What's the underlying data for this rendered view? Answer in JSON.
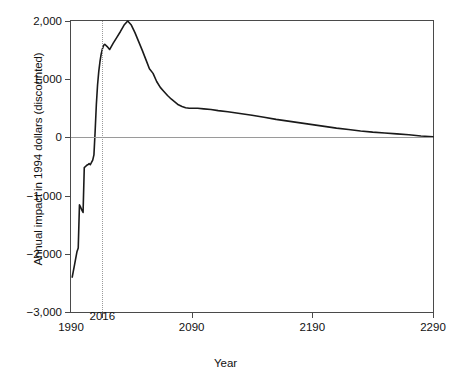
{
  "chart_data": {
    "type": "line",
    "title": "",
    "xlabel": "Year",
    "ylabel": "Annual impact in 1994 dollars (discounted)",
    "xlim": [
      1990,
      2290
    ],
    "ylim": [
      -3000,
      2000
    ],
    "grid": false,
    "legend": null,
    "xticks": [
      {
        "value": 1990,
        "label": "1990",
        "raised": false
      },
      {
        "value": 2016,
        "label": "2016",
        "raised": true
      },
      {
        "value": 2090,
        "label": "2090",
        "raised": false
      },
      {
        "value": 2190,
        "label": "2190",
        "raised": false
      },
      {
        "value": 2290,
        "label": "2290",
        "raised": false
      }
    ],
    "yticks": [
      {
        "value": 2000,
        "label": "2,000"
      },
      {
        "value": 1000,
        "label": "1,000"
      },
      {
        "value": 0,
        "label": "0"
      },
      {
        "value": -1000,
        "label": "−1,000"
      },
      {
        "value": -2000,
        "label": "−2,000"
      },
      {
        "value": -3000,
        "label": "−3,000"
      }
    ],
    "annotations": [
      {
        "name": "marker-2016",
        "type": "vline",
        "x": 2016,
        "style": "dotted",
        "color": "#9a9a9a"
      },
      {
        "name": "zero-reference",
        "type": "hline",
        "y": 0,
        "style": "solid",
        "color": "#9a9a9a"
      }
    ],
    "series": [
      {
        "name": "Annual impact",
        "color": "#1a1a1a",
        "x": [
          1991,
          1993,
          1995,
          1996,
          1997,
          1998,
          1999,
          2000,
          2001,
          2002,
          2003,
          2004,
          2005,
          2006,
          2007,
          2008,
          2009,
          2010,
          2011,
          2012,
          2013,
          2014,
          2015,
          2016,
          2017,
          2018,
          2020,
          2022,
          2025,
          2028,
          2031,
          2034,
          2037,
          2040,
          2043,
          2046,
          2049,
          2052,
          2055,
          2058,
          2061,
          2064,
          2067,
          2070,
          2073,
          2076,
          2079,
          2082,
          2085,
          2088,
          2091,
          2095,
          2100,
          2106,
          2112,
          2120,
          2130,
          2140,
          2150,
          2160,
          2170,
          2180,
          2190,
          2200,
          2210,
          2220,
          2230,
          2240,
          2250,
          2260,
          2270,
          2280,
          2290
        ],
        "y": [
          -2400,
          -2180,
          -1960,
          -1900,
          -1160,
          -1200,
          -1250,
          -1290,
          -520,
          -500,
          -480,
          -470,
          -450,
          -470,
          -430,
          -390,
          -300,
          100,
          560,
          900,
          1130,
          1300,
          1430,
          1520,
          1580,
          1600,
          1560,
          1510,
          1620,
          1720,
          1820,
          1930,
          2000,
          1930,
          1800,
          1650,
          1500,
          1340,
          1180,
          1100,
          960,
          860,
          790,
          720,
          660,
          610,
          560,
          530,
          510,
          500,
          500,
          500,
          490,
          480,
          460,
          440,
          410,
          380,
          345,
          310,
          280,
          250,
          220,
          190,
          160,
          135,
          110,
          90,
          75,
          60,
          45,
          25,
          10
        ]
      }
    ]
  },
  "figure": {
    "caption": ""
  }
}
